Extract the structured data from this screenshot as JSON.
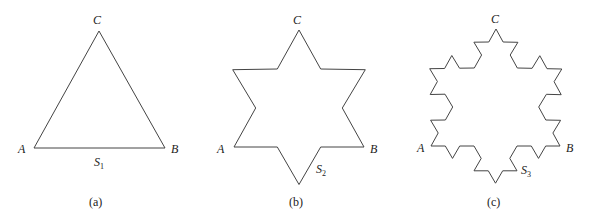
{
  "figures": [
    {
      "id": "a",
      "caption": "(a)",
      "iterations": 0,
      "vertices": {
        "A": [
          34,
          148
        ],
        "B": [
          165,
          148
        ],
        "C": [
          99,
          31
        ]
      },
      "labels": {
        "A": "A",
        "B": "B",
        "C": "C",
        "S": "S",
        "S_sub": "1"
      },
      "caption_pos": [
        89,
        196
      ],
      "label_pos": {
        "A": [
          18,
          143
        ],
        "B": [
          171,
          143
        ],
        "C": [
          93,
          14
        ],
        "S": [
          94,
          156
        ]
      }
    },
    {
      "id": "b",
      "caption": "(b)",
      "iterations": 1,
      "vertices": {
        "A": [
          234,
          147
        ],
        "B": [
          364,
          147
        ],
        "C": [
          299,
          30
        ]
      },
      "labels": {
        "A": "A",
        "B": "B",
        "C": "C",
        "S": "S",
        "S_sub": "2"
      },
      "caption_pos": [
        289,
        196
      ],
      "label_pos": {
        "A": [
          217,
          143
        ],
        "B": [
          370,
          143
        ],
        "C": [
          293,
          14
        ],
        "S": [
          316,
          163
        ]
      }
    },
    {
      "id": "c",
      "caption": "(c)",
      "iterations": 2,
      "vertices": {
        "A": [
          431,
          146
        ],
        "B": [
          560,
          146
        ],
        "C": [
          496,
          29
        ]
      },
      "labels": {
        "A": "A",
        "B": "B",
        "C": "C",
        "S": "S",
        "S_sub": "3"
      },
      "caption_pos": [
        487,
        196
      ],
      "label_pos": {
        "A": [
          417,
          142
        ],
        "B": [
          566,
          142
        ],
        "C": [
          491,
          13
        ],
        "S": [
          521,
          164
        ]
      }
    }
  ],
  "stroke_color": "#444444"
}
